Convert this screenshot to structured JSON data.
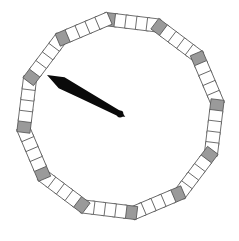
{
  "widget": {
    "name": "polygonal-dial-gauge",
    "background_color": "#ffffff",
    "width": 239,
    "height": 241
  },
  "dial": {
    "shape": "dodecagon",
    "sides": 12,
    "center": {
      "x": 120.5,
      "y": 116.0
    },
    "radius": 104.0,
    "rotation_deg": -8.0,
    "segment_size": 13.2,
    "segments_per_side": 5,
    "vertex_marker_index": 0,
    "vertex_fill_color": "#9a9a9a",
    "tick_fill_color": "#ffffff",
    "tick_stroke_color": "#555555",
    "tick_stroke_width": 0.8,
    "total_segments": 60
  },
  "needle": {
    "name": "dial-needle",
    "fill_color": "#0a0a0a",
    "pivot": {
      "x": 120.0,
      "y": 114.0
    },
    "tip": {
      "x": 47.0,
      "y": 75.0
    },
    "angle_deg": 208.1,
    "length": 83.0,
    "max_half_width": 6.2,
    "hub_radius": 3.4,
    "belly_position": 0.34
  }
}
